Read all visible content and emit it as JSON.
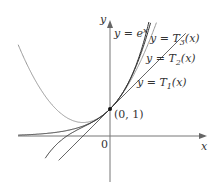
{
  "chart_data": {
    "type": "line",
    "title": "",
    "xlabel": "x",
    "ylabel": "y",
    "origin_label": "0",
    "point": {
      "x": 0,
      "y": 1,
      "label": "(0, 1)"
    },
    "series": [
      {
        "name": "y = e^x",
        "label": "y = e",
        "label_sup": "x",
        "function": "exp(x)",
        "color": "#555555"
      },
      {
        "name": "y = T_3(x)",
        "label": "y = T",
        "label_sub": "3",
        "label_tail": "(x)",
        "function": "1 + x + x^2/2 + x^3/6",
        "color": "#333333"
      },
      {
        "name": "y = T_2(x)",
        "label": "y = T",
        "label_sub": "2",
        "label_tail": "(x)",
        "function": "1 + x + x^2/2",
        "color": "#888888"
      },
      {
        "name": "y = T_1(x)",
        "label": "y = T",
        "label_sub": "1",
        "label_tail": "(x)",
        "function": "1 + x",
        "color": "#333333"
      }
    ],
    "xlim": [
      -3.7,
      4.0
    ],
    "ylim": [
      -2.1,
      4.8
    ],
    "grid": false,
    "legend": "inline labels"
  }
}
